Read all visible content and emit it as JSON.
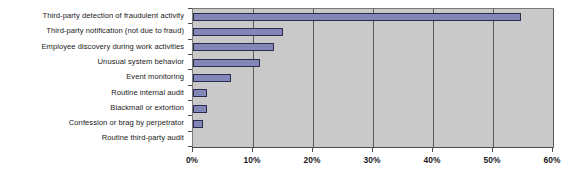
{
  "chart_data": {
    "type": "bar",
    "orientation": "horizontal",
    "title": "",
    "subtitle": "",
    "xlabel": "",
    "ylabel": "",
    "xlim": [
      0,
      60
    ],
    "ylim": null,
    "grid": true,
    "legend": null,
    "legend_position": "none",
    "xtick_labels": [
      "0%",
      "10%",
      "20%",
      "30%",
      "40%",
      "50%",
      "60%"
    ],
    "xtick_values": [
      0,
      10,
      20,
      30,
      40,
      50,
      60
    ],
    "categories": [
      "Third-party detection of fraudulent activity",
      "Third-party notification (not due to fraud)",
      "Employee discovery during work activities",
      "Unusual system behavior",
      "Event monitoring",
      "Routine internal audit",
      "Blackmail or extortion",
      "Confession or brag by perpetrator",
      "Routine third-party audit"
    ],
    "values": [
      54.7,
      15.0,
      13.5,
      11.2,
      6.3,
      2.3,
      2.3,
      1.7,
      0
    ],
    "units": "percent",
    "colors": {
      "bar_fill": "#8286b8",
      "bar_border": "#2b2b4a",
      "plot_background": "#c9c9c9",
      "gridline": "#5a5a5a",
      "axis": "#4a4a4a",
      "text": "#1a1a1a",
      "page_background": "#ffffff"
    }
  }
}
